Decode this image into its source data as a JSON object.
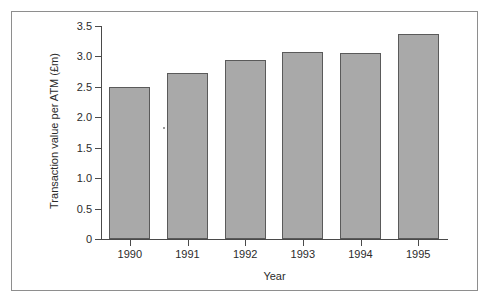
{
  "chart_data": {
    "type": "bar",
    "title": "",
    "xlabel": "Year",
    "ylabel": "Transaction value per ATM (£m)",
    "categories": [
      "1990",
      "1991",
      "1992",
      "1993",
      "1994",
      "1995"
    ],
    "values": [
      2.5,
      2.73,
      2.94,
      3.07,
      3.05,
      3.37
    ],
    "series": [
      {
        "name": "Transaction value per ATM",
        "values": [
          2.5,
          2.73,
          2.94,
          3.07,
          3.05,
          3.37
        ]
      }
    ],
    "ylim": [
      0,
      3.5
    ],
    "yticks": [
      0,
      0.5,
      1.0,
      1.5,
      2.0,
      2.5,
      3.0,
      3.5
    ],
    "ytick_labels": [
      "0",
      "0.5",
      "1.0",
      "1.5",
      "2.0",
      "2.5",
      "3.0",
      "3.5"
    ],
    "grid": false,
    "legend": null,
    "legend_position": "none",
    "bar_fill_color": "#a9a9a9",
    "bar_edge_color": "#5a5a5a",
    "axis_color": "#4a4a4a",
    "frame_color": "#8e8e8e",
    "background_color": "#ffffff"
  }
}
